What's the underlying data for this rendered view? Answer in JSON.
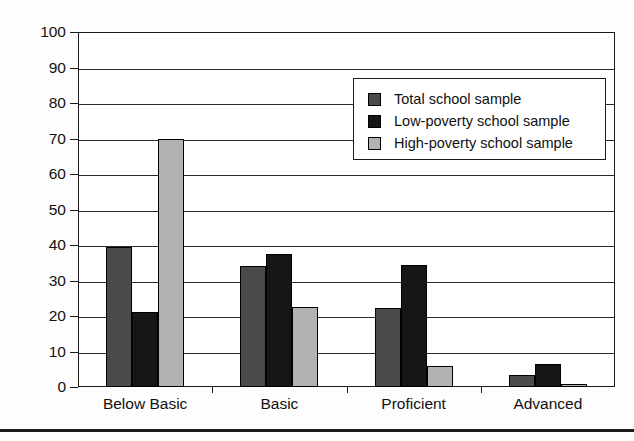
{
  "chart_data": {
    "type": "bar",
    "title": "",
    "xlabel": "",
    "ylabel": "",
    "categories": [
      "Below Basic",
      "Basic",
      "Proficient",
      "Advanced"
    ],
    "series": [
      {
        "name": "Total school sample",
        "color": "#4a4a4a",
        "values": [
          39.5,
          34.0,
          22.3,
          3.5
        ]
      },
      {
        "name": "Low-poverty school sample",
        "color": "#161616",
        "values": [
          21.0,
          37.5,
          34.5,
          6.5
        ]
      },
      {
        "name": "High-poverty school sample",
        "color": "#b2b2b2",
        "values": [
          70.0,
          22.5,
          6.0,
          0.8
        ]
      }
    ],
    "ylim": [
      0,
      100
    ],
    "yticks": [
      0,
      10,
      20,
      30,
      40,
      50,
      60,
      70,
      80,
      90,
      100
    ],
    "ytick_labels": [
      "0",
      "10",
      "20",
      "30",
      "40",
      "50",
      "60",
      "70",
      "80",
      "90",
      "100"
    ],
    "grid": true,
    "grid_axis": "y",
    "legend_position": "upper right"
  },
  "legend": {
    "entries": [
      {
        "label": "Total school sample"
      },
      {
        "label": "Low-poverty school sample"
      },
      {
        "label": "High-poverty school sample"
      }
    ]
  }
}
